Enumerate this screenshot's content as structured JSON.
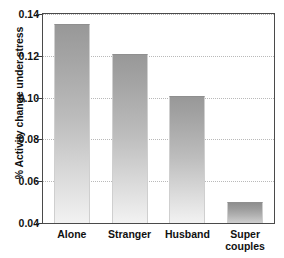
{
  "chart_data": {
    "type": "bar",
    "title": "",
    "xlabel": "",
    "ylabel": "% Activity change under stress",
    "categories": [
      "Alone",
      "Stranger",
      "Husband",
      "Super couples"
    ],
    "category_lines": [
      [
        "Alone"
      ],
      [
        "Stranger"
      ],
      [
        "Husband"
      ],
      [
        "Super",
        "couples"
      ]
    ],
    "values": [
      0.135,
      0.121,
      0.101,
      0.05
    ],
    "ylim": [
      0.04,
      0.14
    ],
    "yticks": [
      0.04,
      0.06,
      0.08,
      0.1,
      0.12,
      0.14
    ],
    "ytick_labels": [
      "0.04",
      "0.06",
      "0.08",
      "0.10",
      "0.12",
      "0.14"
    ],
    "grid": true,
    "grid_axis": "y",
    "legend": false,
    "bar_color": "#a8a8a8",
    "bar_gradient_top": "#989898",
    "bar_gradient_bottom": "#f2f2f2",
    "axis_color": "#4a4a4a",
    "grid_color": "#b9b9b9",
    "text_color": "#111111"
  }
}
